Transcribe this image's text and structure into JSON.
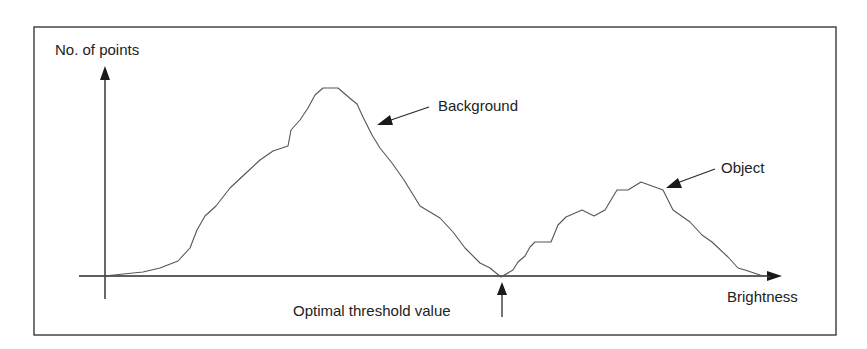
{
  "diagram": {
    "y_axis_label": "No. of points",
    "x_axis_label": "Brightness",
    "annotations": {
      "background": "Background",
      "object": "Object",
      "threshold": "Optimal threshold value"
    },
    "colors": {
      "frame": "#3a3a3a",
      "axis": "#2a2a2a",
      "curve": "#555555",
      "text": "#222222"
    }
  },
  "chart_data": {
    "type": "line",
    "title": "",
    "xlabel": "Brightness",
    "ylabel": "No. of points",
    "grid": false,
    "series": [
      {
        "name": "Histogram",
        "points_px": [
          [
            104,
            276
          ],
          [
            143,
            272
          ],
          [
            160,
            268
          ],
          [
            178,
            261
          ],
          [
            190,
            248
          ],
          [
            197,
            230
          ],
          [
            205,
            216
          ],
          [
            216,
            206
          ],
          [
            230,
            188
          ],
          [
            245,
            174
          ],
          [
            260,
            160
          ],
          [
            273,
            151
          ],
          [
            288,
            146
          ],
          [
            291,
            130
          ],
          [
            300,
            120
          ],
          [
            308,
            108
          ],
          [
            315,
            95
          ],
          [
            323,
            88
          ],
          [
            338,
            88
          ],
          [
            352,
            100
          ],
          [
            357,
            104
          ],
          [
            363,
            117
          ],
          [
            372,
            135
          ],
          [
            380,
            148
          ],
          [
            392,
            163
          ],
          [
            404,
            180
          ],
          [
            420,
            206
          ],
          [
            440,
            218
          ],
          [
            453,
            232
          ],
          [
            465,
            248
          ],
          [
            480,
            263
          ],
          [
            490,
            268
          ],
          [
            501,
            277
          ],
          [
            513,
            270
          ],
          [
            518,
            262
          ],
          [
            525,
            256
          ],
          [
            530,
            247
          ],
          [
            535,
            242
          ],
          [
            551,
            242
          ],
          [
            558,
            225
          ],
          [
            566,
            217
          ],
          [
            582,
            210
          ],
          [
            594,
            216
          ],
          [
            605,
            210
          ],
          [
            617,
            190
          ],
          [
            628,
            190
          ],
          [
            641,
            182
          ],
          [
            663,
            190
          ],
          [
            673,
            210
          ],
          [
            690,
            222
          ],
          [
            702,
            235
          ],
          [
            712,
            242
          ],
          [
            728,
            257
          ],
          [
            738,
            268
          ],
          [
            745,
            270
          ],
          [
            760,
            275
          ],
          [
            770,
            277
          ]
        ]
      }
    ],
    "peaks": [
      {
        "label": "Background",
        "description": "larger peak at lower brightness"
      },
      {
        "label": "Object",
        "description": "smaller peak at higher brightness"
      }
    ],
    "threshold": {
      "label": "Optimal threshold value",
      "position": "valley minimum between peaks"
    }
  }
}
